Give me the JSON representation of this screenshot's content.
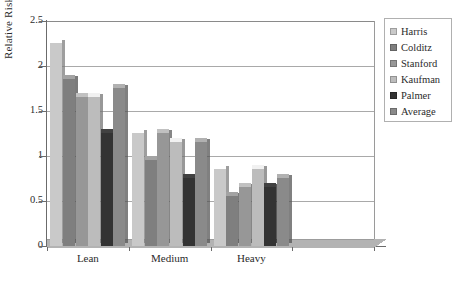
{
  "chart_data": {
    "type": "bar",
    "title": "",
    "xlabel": "",
    "ylabel": "Relative Risk",
    "categories": [
      "Lean",
      "Medium",
      "Heavy",
      ""
    ],
    "ylim": [
      0,
      2.5
    ],
    "ytick_labels": [
      "0",
      "0.5",
      "1",
      "1.5",
      "2",
      "2.5"
    ],
    "ytick_values": [
      0,
      0.5,
      1,
      1.5,
      2,
      2.5
    ],
    "grid": "horizontal",
    "legend_position": "right",
    "style": "3d-clustered-column",
    "series": [
      {
        "name": "Harris",
        "color": "#c9c9c9",
        "values": [
          2.3,
          1.3,
          0.9,
          null
        ]
      },
      {
        "name": "Colditz",
        "color": "#7f7f7f",
        "values": [
          1.9,
          1.0,
          0.6,
          null
        ]
      },
      {
        "name": "Stanford",
        "color": "#979797",
        "values": [
          1.7,
          1.3,
          0.7,
          null
        ]
      },
      {
        "name": "Kaufman",
        "color": "#bcbcbc",
        "values": [
          1.7,
          1.2,
          0.9,
          null
        ]
      },
      {
        "name": "Palmer",
        "color": "#333333",
        "values": [
          1.3,
          0.8,
          0.7,
          null
        ]
      },
      {
        "name": "Average",
        "color": "#8a8a8a",
        "values": [
          1.8,
          1.2,
          0.8,
          null
        ]
      }
    ]
  },
  "legend": {
    "items": [
      {
        "label": "Harris"
      },
      {
        "label": "Colditz"
      },
      {
        "label": "Stanford"
      },
      {
        "label": "Kaufman"
      },
      {
        "label": "Palmer"
      },
      {
        "label": "Average"
      }
    ]
  },
  "colors": {
    "grid": "#a9a9a9",
    "axis": "#6b6b6b",
    "floor": "#b3b3b3",
    "legend_border": "#b0b0b0",
    "text": "#2b2b2b"
  }
}
